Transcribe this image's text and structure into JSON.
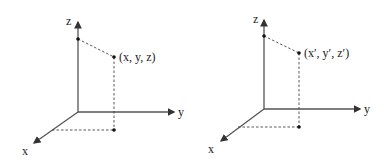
{
  "diagrams": [
    {
      "axes": {
        "x": "x",
        "y": "y",
        "z": "z"
      },
      "point_label": "(x, y, z)"
    },
    {
      "axes": {
        "x": "x",
        "y": "y",
        "z": "z"
      },
      "point_label": "(x′, y′, z′)"
    }
  ]
}
